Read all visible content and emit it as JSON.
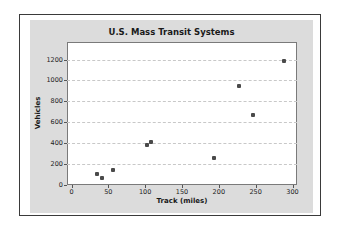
{
  "chart_data": {
    "type": "scatter",
    "title": "U.S. Mass Transit Systems",
    "xlabel": "Track (miles)",
    "ylabel": "Vehicles",
    "xlim": [
      0,
      300
    ],
    "ylim": [
      0,
      1200
    ],
    "x_ticks": [
      0,
      50,
      100,
      150,
      200,
      250,
      300
    ],
    "y_ticks": [
      0,
      200,
      400,
      600,
      800,
      1000,
      1200
    ],
    "grid": "horizontal dashed",
    "legend": "none",
    "series": [
      {
        "name": "Systems",
        "points": [
          {
            "x": 35,
            "y": 100
          },
          {
            "x": 42,
            "y": 60
          },
          {
            "x": 57,
            "y": 140
          },
          {
            "x": 103,
            "y": 375
          },
          {
            "x": 108,
            "y": 410
          },
          {
            "x": 193,
            "y": 255
          },
          {
            "x": 227,
            "y": 950
          },
          {
            "x": 247,
            "y": 670
          },
          {
            "x": 288,
            "y": 1190
          }
        ]
      }
    ]
  },
  "colors": {
    "panel": "#dcdcdc",
    "plot_bg": "#ffffff",
    "point": "#4a4a4a",
    "grid": "#c8c8c8"
  }
}
